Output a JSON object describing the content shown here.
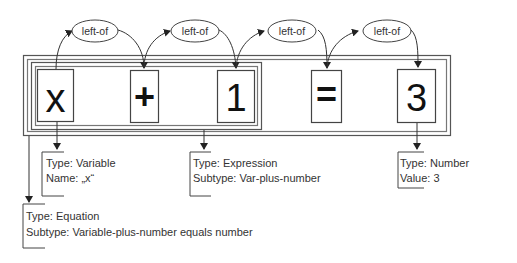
{
  "diagram": {
    "tokens": [
      {
        "id": "x",
        "text": "x"
      },
      {
        "id": "plus",
        "text": "+"
      },
      {
        "id": "one",
        "text": "1"
      },
      {
        "id": "equals",
        "text": "="
      },
      {
        "id": "three",
        "text": "3"
      }
    ],
    "relations": [
      {
        "label": "left-of",
        "from": "x",
        "to": "plus"
      },
      {
        "label": "left-of",
        "from": "plus",
        "to": "one"
      },
      {
        "label": "left-of",
        "from": "one",
        "to": "equals"
      },
      {
        "label": "left-of",
        "from": "equals",
        "to": "three"
      }
    ],
    "annotations": {
      "variable": {
        "line1": "Type: Variable",
        "line2": "Name: „x“"
      },
      "expression": {
        "line1": "Type: Expression",
        "line2": "Subtype: Var-plus-number"
      },
      "number": {
        "line1": "Type: Number",
        "line2": "Value: 3"
      },
      "equation": {
        "line1": "Type: Equation",
        "line2": "Subtype: Variable-plus-number equals number"
      }
    }
  }
}
